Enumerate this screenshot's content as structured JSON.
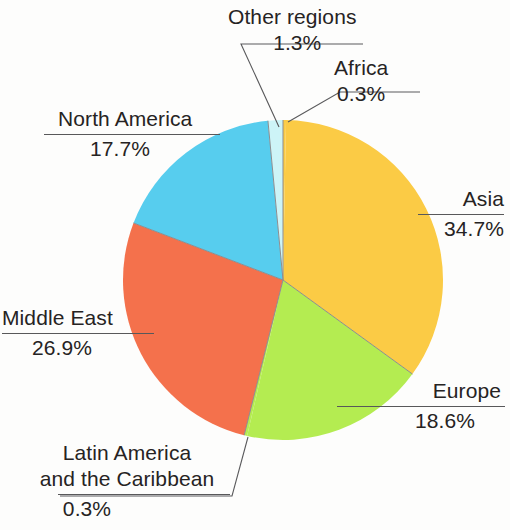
{
  "chart_data": {
    "type": "pie",
    "title": "",
    "subtitle": "",
    "xlabel": "",
    "ylabel": "",
    "legend_position": "callout-labels",
    "grid": false,
    "units": "percent",
    "start_angle_deg": 0,
    "direction": "clockwise",
    "categories": [
      "Africa",
      "Asia",
      "Europe",
      "Latin America and the Caribbean",
      "Middle East",
      "North America",
      "Other regions"
    ],
    "values": [
      0.3,
      34.7,
      18.6,
      0.3,
      26.9,
      17.7,
      1.3
    ],
    "value_labels": [
      "0.3%",
      "34.7%",
      "18.6%",
      "0.3%",
      "26.9%",
      "17.7%",
      "1.3%"
    ],
    "colors": [
      "#FBCB45",
      "#FBCB45",
      "#B4EC51",
      "#B4EC51",
      "#F4714C",
      "#57CDEE",
      "#CDF4F7"
    ],
    "slices": [
      {
        "name": "Africa",
        "value": 0.3,
        "value_label": "0.3%",
        "color": "#FBCB45",
        "start_deg": 0,
        "sweep_deg": 1.08
      },
      {
        "name": "Asia",
        "value": 34.7,
        "value_label": "34.7%",
        "color": "#FBCB45",
        "start_deg": 1.08,
        "sweep_deg": 124.92
      },
      {
        "name": "Europe",
        "value": 18.6,
        "value_label": "18.6%",
        "color": "#B4EC51",
        "start_deg": 126.0,
        "sweep_deg": 66.96
      },
      {
        "name": "Latin America and the Caribbean",
        "value": 0.3,
        "value_label": "0.3%",
        "color": "#B4EC51",
        "start_deg": 192.96,
        "sweep_deg": 1.08
      },
      {
        "name": "Middle East",
        "value": 26.9,
        "value_label": "26.9%",
        "color": "#F4714C",
        "start_deg": 194.04,
        "sweep_deg": 96.84
      },
      {
        "name": "North America",
        "value": 17.7,
        "value_label": "17.7%",
        "color": "#57CDEE",
        "start_deg": 290.88,
        "sweep_deg": 63.72
      },
      {
        "name": "Other regions",
        "value": 1.3,
        "value_label": "1.3%",
        "color": "#CDF4F7",
        "start_deg": 354.6,
        "sweep_deg": 5.4
      }
    ]
  },
  "labels": {
    "other_regions": {
      "name": "Other regions",
      "value": "1.3%"
    },
    "africa": {
      "name": "Africa",
      "value": "0.3%"
    },
    "asia": {
      "name": "Asia",
      "value": "34.7%"
    },
    "europe": {
      "name": "Europe",
      "value": "18.6%"
    },
    "latin_america": {
      "name_line1": "Latin America",
      "name_line2": "and the Caribbean",
      "value": "0.3%"
    },
    "middle_east": {
      "name": "Middle East",
      "value": "26.9%"
    },
    "north_america": {
      "name": "North America",
      "value": "17.7%"
    }
  },
  "style": {
    "background": "#fdfdfc",
    "text_color": "#262323",
    "rule_color": "#58585a",
    "leader_color": "#5a5a5c",
    "slice_divider_color": "#8d8d8f"
  }
}
